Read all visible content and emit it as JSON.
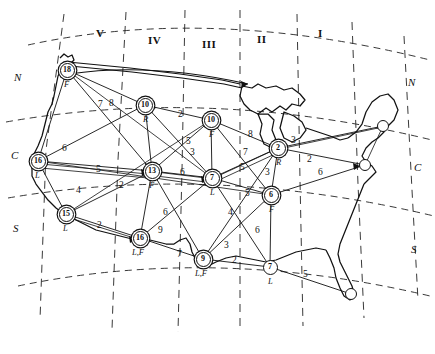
{
  "figure": {
    "name": "us-network-map"
  },
  "zones": [
    {
      "id": "zone-5",
      "label": "V",
      "x": 96,
      "y": 27
    },
    {
      "id": "zone-4",
      "label": "IV",
      "x": 148,
      "y": 34
    },
    {
      "id": "zone-3",
      "label": "III",
      "x": 202,
      "y": 38
    },
    {
      "id": "zone-2",
      "label": "II",
      "x": 257,
      "y": 33
    },
    {
      "id": "zone-1",
      "label": "I",
      "x": 318,
      "y": 27
    }
  ],
  "bands": [
    {
      "id": "band-n-left",
      "label": "N",
      "x": 14,
      "y": 71
    },
    {
      "id": "band-c-left",
      "label": "C",
      "x": 11,
      "y": 149
    },
    {
      "id": "band-s-left",
      "label": "S",
      "x": 13,
      "y": 222
    },
    {
      "id": "band-n-right",
      "label": "N",
      "x": 408,
      "y": 76
    },
    {
      "id": "band-c-right",
      "label": "C",
      "x": 414,
      "y": 161
    },
    {
      "id": "band-s-right",
      "label": "S",
      "x": 411,
      "y": 243
    }
  ],
  "nodes": [
    {
      "id": "node-18",
      "value": "18",
      "sub": "F",
      "x": 67,
      "y": 70,
      "r": 7.5,
      "style": "double",
      "sub_dx": -3,
      "sub_dy": 9
    },
    {
      "id": "node-10r",
      "value": "10",
      "sub": "R",
      "x": 145,
      "y": 105,
      "r": 7.5,
      "style": "double",
      "sub_dx": -2,
      "sub_dy": 9
    },
    {
      "id": "node-10f",
      "value": "10",
      "sub": "F",
      "x": 211,
      "y": 120,
      "r": 7.5,
      "style": "double",
      "sub_dx": -2,
      "sub_dy": 9
    },
    {
      "id": "node-2r",
      "value": "2",
      "sub": "R",
      "x": 278,
      "y": 148,
      "r": 7.5,
      "style": "double",
      "sub_dx": -2,
      "sub_dy": 9
    },
    {
      "id": "node-16l",
      "value": "16",
      "sub": "L",
      "x": 38,
      "y": 161,
      "r": 7.5,
      "style": "double",
      "sub_dx": -3,
      "sub_dy": 9
    },
    {
      "id": "node-13f",
      "value": "13",
      "sub": "F",
      "x": 152,
      "y": 171,
      "r": 7.5,
      "style": "double",
      "sub_dx": -3,
      "sub_dy": 9
    },
    {
      "id": "node-7l",
      "value": "7",
      "sub": "L",
      "x": 212,
      "y": 178,
      "r": 7.5,
      "style": "double",
      "sub_dx": -2,
      "sub_dy": 9
    },
    {
      "id": "node-6f",
      "value": "6",
      "sub": "F",
      "x": 271,
      "y": 195,
      "r": 7.5,
      "style": "double",
      "sub_dx": -2,
      "sub_dy": 9
    },
    {
      "id": "node-15l",
      "value": "15",
      "sub": "L",
      "x": 66,
      "y": 214,
      "r": 7.5,
      "style": "double",
      "sub_dx": -3,
      "sub_dy": 9
    },
    {
      "id": "node-16lf",
      "value": "16",
      "sub": "L,F",
      "x": 140,
      "y": 238,
      "r": 7.5,
      "style": "double",
      "sub_dx": -8,
      "sub_dy": 9
    },
    {
      "id": "node-9lf",
      "value": "9",
      "sub": "L,F",
      "x": 203,
      "y": 259,
      "r": 7.5,
      "style": "double",
      "sub_dx": -8,
      "sub_dy": 9
    },
    {
      "id": "node-7lb",
      "value": "7",
      "sub": "L",
      "x": 270,
      "y": 267,
      "r": 7.5,
      "style": "plain",
      "sub_dx": -2,
      "sub_dy": 9
    }
  ],
  "terminals": [
    {
      "id": "terminal-northeast",
      "x": 383,
      "y": 126,
      "r": 6
    },
    {
      "id": "terminal-midatlantic",
      "x": 365,
      "y": 165,
      "r": 6
    },
    {
      "id": "terminal-florida",
      "x": 351,
      "y": 294,
      "r": 6
    }
  ],
  "edges": [
    {
      "id": "e-18-10r",
      "from": "node-18",
      "to": "node-10r",
      "weight": "8",
      "lx": 109,
      "ly": 99
    },
    {
      "id": "e-18-13f",
      "from": "node-18",
      "to": "node-13f",
      "weight": "7",
      "lx": 98,
      "ly": 100
    },
    {
      "id": "e-10r-10f",
      "from": "node-10r",
      "to": "node-10f",
      "weight": "2",
      "lx": 178,
      "ly": 110
    },
    {
      "id": "e-10r-13f",
      "from": "node-10r",
      "to": "node-13f",
      "weight": "5",
      "lx": 186,
      "ly": 137
    },
    {
      "id": "e-10f-2r",
      "from": "node-10f",
      "to": "node-2r",
      "weight": "8",
      "lx": 248,
      "ly": 130
    },
    {
      "id": "e-10f-7l",
      "from": "node-10f",
      "to": "node-7l",
      "weight": "3",
      "lx": 190,
      "ly": 148
    },
    {
      "id": "e-10f-13f",
      "from": "node-10f",
      "to": "node-13f",
      "weight": "7",
      "lx": 243,
      "ly": 148
    },
    {
      "id": "e-2r-terminal",
      "from": "node-2r",
      "to": "terminal-northeast",
      "weight": "3",
      "lx": 291,
      "ly": 136
    },
    {
      "id": "e-2r-mid",
      "from": "node-2r",
      "to": "terminal-midatlantic",
      "weight": "2",
      "lx": 307,
      "ly": 155
    },
    {
      "id": "e-2r-6f",
      "from": "node-2r",
      "to": "node-6f",
      "weight": "3",
      "lx": 265,
      "ly": 168
    },
    {
      "id": "e-6f-mid",
      "from": "node-6f",
      "to": "terminal-midatlantic",
      "weight": "6",
      "lx": 318,
      "ly": 168
    },
    {
      "id": "e-16l-18",
      "from": "node-16l",
      "to": "node-18",
      "weight": "6",
      "lx": 62,
      "ly": 144
    },
    {
      "id": "e-16l-13f",
      "from": "node-16l",
      "to": "node-13f",
      "weight": "5",
      "lx": 96,
      "ly": 165
    },
    {
      "id": "e-16l-15l",
      "from": "node-16l",
      "to": "node-15l",
      "weight": "4",
      "lx": 76,
      "ly": 186
    },
    {
      "id": "e-15l-13f",
      "from": "node-15l",
      "to": "node-13f",
      "weight": "2",
      "lx": 119,
      "ly": 181
    },
    {
      "id": "e-15l-16lf",
      "from": "node-15l",
      "to": "node-16lf",
      "weight": "2",
      "lx": 97,
      "ly": 221
    },
    {
      "id": "e-13f-7l",
      "from": "node-13f",
      "to": "node-7l",
      "weight": "6",
      "lx": 180,
      "ly": 168
    },
    {
      "id": "e-13f-16lf",
      "from": "node-13f",
      "to": "node-16lf",
      "weight": "6",
      "lx": 163,
      "ly": 208
    },
    {
      "id": "e-7l-6f",
      "from": "node-7l",
      "to": "node-6f",
      "weight": "5",
      "lx": 245,
      "ly": 189
    },
    {
      "id": "e-7l-2r",
      "from": "node-7l",
      "to": "node-2r",
      "weight": "5",
      "lx": 240,
      "ly": 163
    },
    {
      "id": "e-7l-7lb",
      "from": "node-7l",
      "to": "node-7lb",
      "weight": "4",
      "lx": 228,
      "ly": 208
    },
    {
      "id": "e-6f-7lb",
      "from": "node-6f",
      "to": "node-7lb",
      "weight": "6",
      "lx": 255,
      "ly": 226
    },
    {
      "id": "e-16lf-9lf",
      "from": "node-16lf",
      "to": "node-9lf",
      "weight": "7",
      "lx": 177,
      "ly": 250
    },
    {
      "id": "e-16lf-7l",
      "from": "node-16lf",
      "to": "node-7l",
      "weight": "9",
      "lx": 158,
      "ly": 226
    },
    {
      "id": "e-9lf-7lb",
      "from": "node-9lf",
      "to": "node-7lb",
      "weight": "2",
      "lx": 232,
      "ly": 256
    },
    {
      "id": "e-9lf-6f",
      "from": "node-9lf",
      "to": "node-6f",
      "weight": "3",
      "lx": 224,
      "ly": 241
    },
    {
      "id": "e-7lb-fl",
      "from": "node-7lb",
      "to": "terminal-florida",
      "weight": "5",
      "lx": 303,
      "ly": 270
    }
  ],
  "colors": {
    "ink": "#111111",
    "paper": "#ffffff",
    "grid_dash": "#222222"
  }
}
